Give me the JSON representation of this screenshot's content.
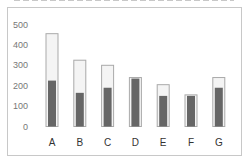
{
  "chart_data": {
    "type": "bar",
    "title": "",
    "xlabel": "",
    "ylabel": "",
    "categories": [
      "A",
      "B",
      "C",
      "D",
      "E",
      "F",
      "G"
    ],
    "series": [
      {
        "name": "total",
        "values": [
          455,
          325,
          300,
          240,
          205,
          155,
          240
        ]
      },
      {
        "name": "inner",
        "values": [
          225,
          165,
          190,
          235,
          150,
          150,
          190
        ]
      }
    ],
    "ylim": [
      0,
      500
    ],
    "yticks": [
      0,
      100,
      200,
      300,
      400,
      500
    ],
    "grid": false,
    "legend": "none",
    "colors": {
      "outer_fill": "#f4f4f4",
      "outer_stroke": "#a9a9a9",
      "inner_fill": "#666666"
    }
  }
}
